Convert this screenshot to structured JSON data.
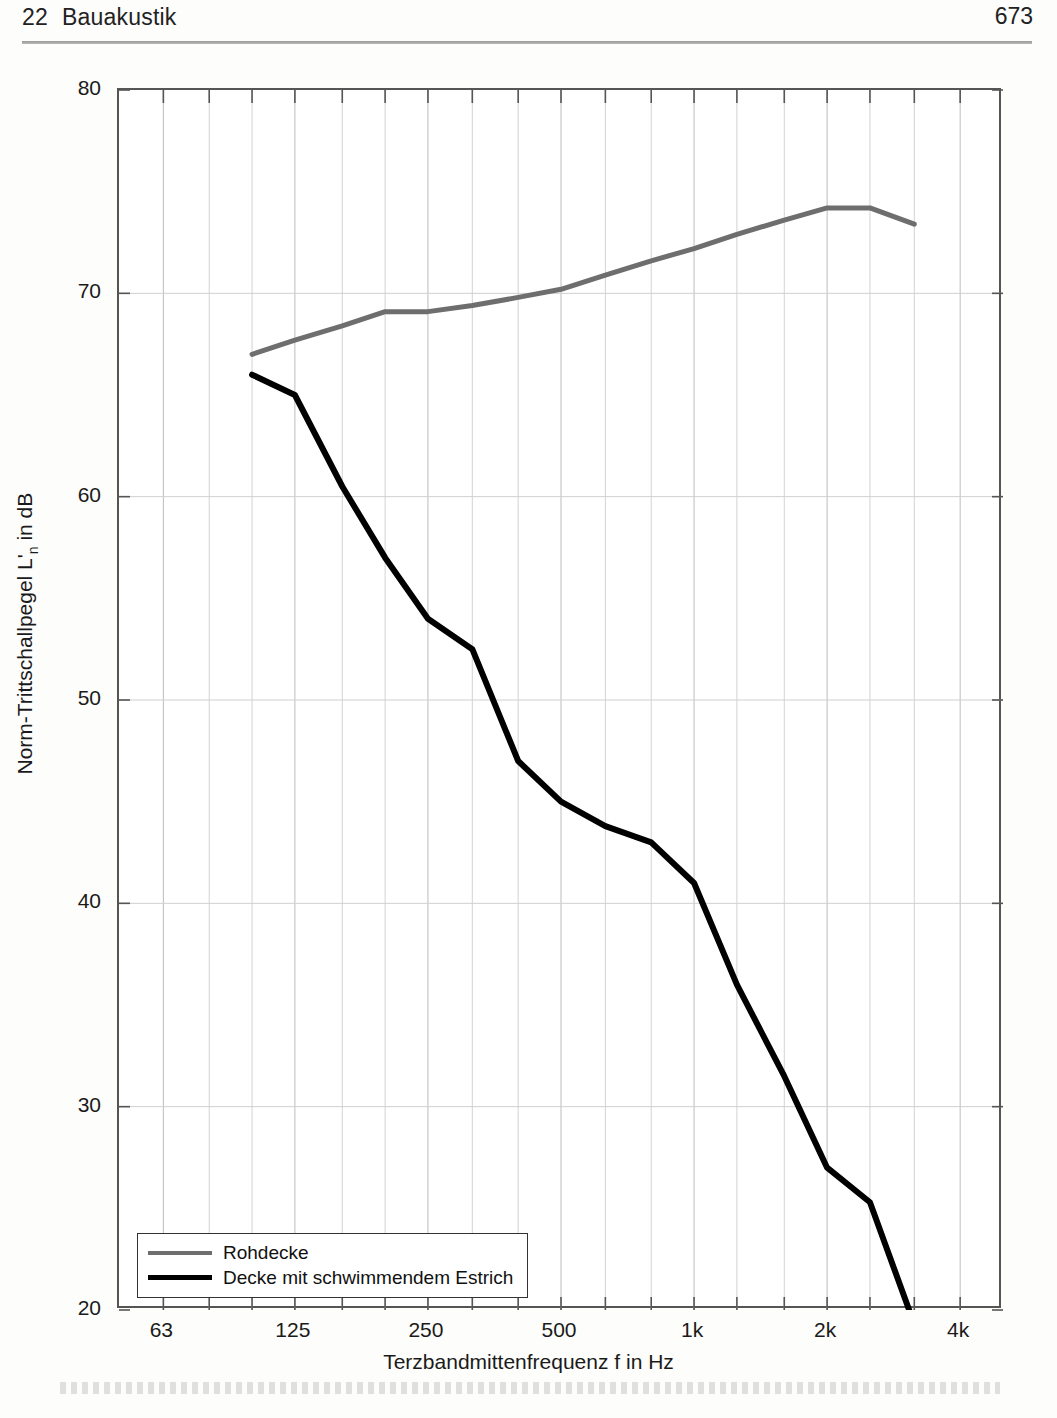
{
  "header": {
    "chapter_number": "22",
    "chapter_title": "Bauakustik",
    "page_number": "673"
  },
  "chart_data": {
    "type": "line",
    "title": "",
    "xlabel": "Terzbandmittenfrequenz f in Hz",
    "ylabel": "Norm-Trittschallpegel L'n in dB",
    "ylabel_main": "Norm-Trittschallpegel L'",
    "ylabel_sub": "n",
    "ylabel_tail": " in dB",
    "xscale": "log",
    "xlim": [
      50,
      5000
    ],
    "ylim": [
      20,
      80
    ],
    "yticks": [
      20,
      30,
      40,
      50,
      60,
      70,
      80
    ],
    "ytick_labels": [
      "20",
      "30",
      "40",
      "50",
      "60",
      "70",
      "80"
    ],
    "xticks": [
      63,
      125,
      250,
      500,
      1000,
      2000,
      4000
    ],
    "xtick_labels": [
      "63",
      "125",
      "250",
      "500",
      "1k",
      "2k",
      "4k"
    ],
    "x_bands": [
      50,
      63,
      80,
      100,
      125,
      160,
      200,
      250,
      315,
      400,
      500,
      630,
      800,
      1000,
      1250,
      1600,
      2000,
      2500,
      3150,
      4000,
      5000
    ],
    "grid": true,
    "legend_position": "bottom-left",
    "series": [
      {
        "name": "Rohdecke",
        "color": "#6e6e6e",
        "x": [
          100,
          125,
          160,
          200,
          250,
          315,
          400,
          500,
          630,
          800,
          1000,
          1250,
          1600,
          2000,
          2500,
          3150
        ],
        "values": [
          67.0,
          67.7,
          68.4,
          69.1,
          69.1,
          69.4,
          69.8,
          70.2,
          70.9,
          71.6,
          72.2,
          72.9,
          73.6,
          74.2,
          74.2,
          73.4
        ]
      },
      {
        "name": "Decke mit schwimmendem Estrich",
        "color": "#000000",
        "x": [
          100,
          125,
          160,
          200,
          250,
          315,
          400,
          500,
          630,
          800,
          1000,
          1250,
          1600,
          2000,
          2500,
          3150
        ],
        "values": [
          66.0,
          65.0,
          60.5,
          57.0,
          54.0,
          52.5,
          47.0,
          45.0,
          43.8,
          43.0,
          41.0,
          36.0,
          31.5,
          27.0,
          25.3,
          19.3
        ]
      }
    ]
  },
  "legend": {
    "items": [
      {
        "label": "Rohdecke",
        "style": "gray"
      },
      {
        "label": "Decke mit schwimmendem Estrich",
        "style": "black"
      }
    ]
  }
}
